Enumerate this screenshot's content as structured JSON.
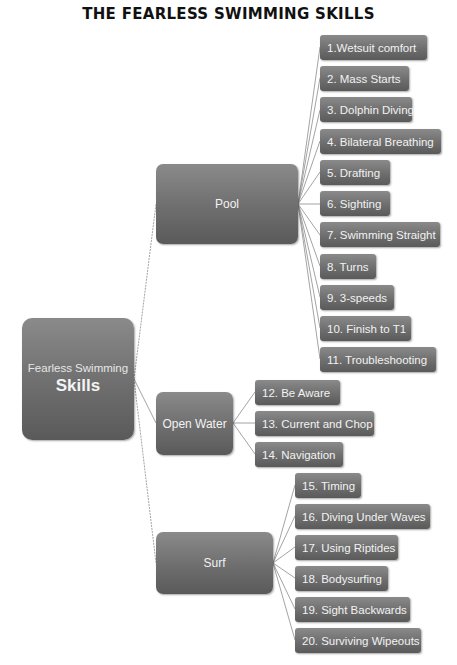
{
  "title": "THE FEARLESS SWIMMING SKILLS",
  "root": {
    "line1": "Fearless Swimming",
    "line2": "Skills"
  },
  "categories": [
    {
      "label": "Pool",
      "skills": [
        "1.Wetsuit comfort",
        "2.  Mass Starts",
        "3. Dolphin Diving",
        "4. Bilateral Breathing",
        "5. Drafting",
        "6. Sighting",
        "7. Swimming Straight",
        "8. Turns",
        "9. 3-speeds",
        "10. Finish to T1",
        "11. Troubleshooting"
      ]
    },
    {
      "label": "Open Water",
      "skills": [
        "12.  Be Aware",
        "13. Current and Chop",
        "14. Navigation"
      ]
    },
    {
      "label": "Surf",
      "skills": [
        "15. Timing",
        "16. Diving Under Waves",
        "17. Using Riptides",
        "18. Bodysurfing",
        "19. Sight Backwards",
        "20. Surviving Wipeouts"
      ]
    }
  ],
  "colors": {
    "node_top": "#8a8a8a",
    "node_bottom": "#5a5a5a",
    "text": "#f2f2f2",
    "connector": "#8c8c8c"
  }
}
